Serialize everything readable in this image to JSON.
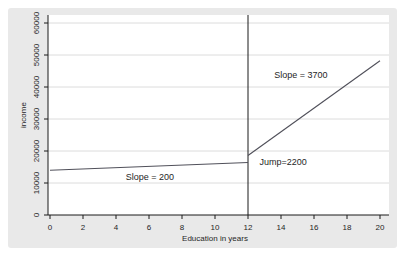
{
  "window": {
    "background": "#ffffff"
  },
  "colors": {
    "panel_bg": "#e9e9e9",
    "plot_bg": "#ffffff",
    "grid": "#dcdcdc",
    "axis": "#1a1a1a",
    "line": "#50505a",
    "reference_line": "#1a1a1a",
    "text": "#262626"
  },
  "chart_data": {
    "type": "line",
    "title": "",
    "xlabel": "Education in years",
    "ylabel": "income",
    "xlim": [
      0,
      20
    ],
    "ylim": [
      0,
      60000
    ],
    "x_ticks": [
      0,
      2,
      4,
      6,
      8,
      10,
      12,
      14,
      16,
      18,
      20
    ],
    "y_ticks": [
      0,
      10000,
      20000,
      30000,
      40000,
      50000,
      60000
    ],
    "grid": "horizontal",
    "legend": "none",
    "cutoff_x": 12,
    "jump": 2200,
    "series": [
      {
        "name": "pre-cutoff-regression",
        "slope": 200,
        "x": [
          0,
          12
        ],
        "y": [
          14000,
          16400
        ]
      },
      {
        "name": "post-cutoff-regression",
        "slope": 3700,
        "x": [
          12,
          20
        ],
        "y": [
          18600,
          48200
        ]
      }
    ],
    "annotations": [
      {
        "id": "slope-left-label",
        "text": "Slope = 200",
        "x": 6.05,
        "y": 11900,
        "anchor": "middle"
      },
      {
        "id": "slope-right-label",
        "text": "Slope = 3700",
        "x": 15.2,
        "y": 43700,
        "anchor": "middle"
      },
      {
        "id": "jump-label",
        "text": "Jump=2200",
        "x": 12.7,
        "y": 16500,
        "anchor": "start"
      }
    ]
  }
}
